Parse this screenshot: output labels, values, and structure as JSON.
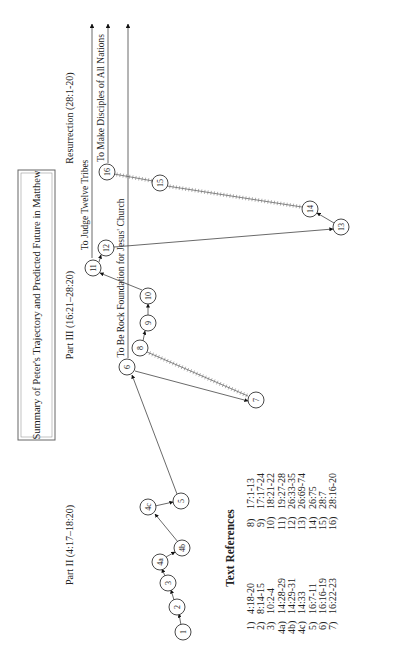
{
  "title": "Summary of Peter's Trajectory and Predicted Future in Matthew",
  "sections": {
    "part2": "Part II (4:17–18:20)",
    "part3": "Part III (16:21–28:20)",
    "resurrection": "Resurrection (28:1-20)"
  },
  "trajectories": {
    "rock": "To Be Rock Foundation for Jesus' Church",
    "judge": "To Judge Twelve Tribes",
    "disciples": "To Make Disciples of All Nations"
  },
  "nodes": [
    {
      "id": "1",
      "label": "1"
    },
    {
      "id": "2",
      "label": "2"
    },
    {
      "id": "3",
      "label": "3"
    },
    {
      "id": "4a",
      "label": "4a"
    },
    {
      "id": "4b",
      "label": "4b"
    },
    {
      "id": "4c",
      "label": "4c"
    },
    {
      "id": "5",
      "label": "5"
    },
    {
      "id": "6",
      "label": "6"
    },
    {
      "id": "7",
      "label": "7"
    },
    {
      "id": "8",
      "label": "8"
    },
    {
      "id": "9",
      "label": "9"
    },
    {
      "id": "10",
      "label": "10"
    },
    {
      "id": "11",
      "label": "11"
    },
    {
      "id": "12",
      "label": "12"
    },
    {
      "id": "13",
      "label": "13"
    },
    {
      "id": "14",
      "label": "14"
    },
    {
      "id": "15",
      "label": "15"
    },
    {
      "id": "16",
      "label": "16"
    }
  ],
  "references": {
    "heading": "Text References",
    "left": [
      {
        "key": "1)",
        "ref": "4:18-20"
      },
      {
        "key": "2)",
        "ref": "8:14-15"
      },
      {
        "key": "3)",
        "ref": "10:2-4"
      },
      {
        "key": "4a)",
        "ref": "14:28-29"
      },
      {
        "key": "4b)",
        "ref": "14:29-31"
      },
      {
        "key": "4c)",
        "ref": "14:33"
      },
      {
        "key": "5)",
        "ref": "16:7-11"
      },
      {
        "key": "6)",
        "ref": "16:16-19"
      },
      {
        "key": "7)",
        "ref": "16:22-23"
      }
    ],
    "right": [
      {
        "key": "8)",
        "ref": "17:1-13"
      },
      {
        "key": "9)",
        "ref": "17:17-24"
      },
      {
        "key": "10)",
        "ref": "18:21-22"
      },
      {
        "key": "11)",
        "ref": "19:27-28"
      },
      {
        "key": "12)",
        "ref": "26:33-35"
      },
      {
        "key": "13)",
        "ref": "26:69-74"
      },
      {
        "key": "14)",
        "ref": "26:75"
      },
      {
        "key": "15)",
        "ref": "28:7"
      },
      {
        "key": "16)",
        "ref": "28:16-20"
      }
    ]
  }
}
